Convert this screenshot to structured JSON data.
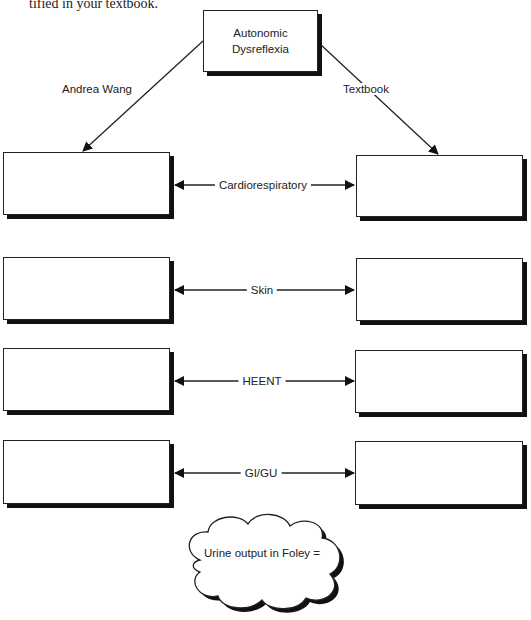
{
  "intro_text": "tified in your textbook.",
  "center_node": {
    "line1": "Autonomic",
    "line2": "Dysreflexia"
  },
  "branches": {
    "left": "Andrea Wang",
    "right": "Textbook"
  },
  "rows": [
    {
      "label": "Cardiorespiratory",
      "left_value": "",
      "right_value": ""
    },
    {
      "label": "Skin",
      "left_value": "",
      "right_value": ""
    },
    {
      "label": "HEENT",
      "left_value": "",
      "right_value": ""
    },
    {
      "label": "GI/GU",
      "left_value": "",
      "right_value": ""
    }
  ],
  "cloud": {
    "text": "Urine output in Foley ="
  },
  "colors": {
    "line": "#222222",
    "shadow": "#111111",
    "background": "#ffffff"
  }
}
